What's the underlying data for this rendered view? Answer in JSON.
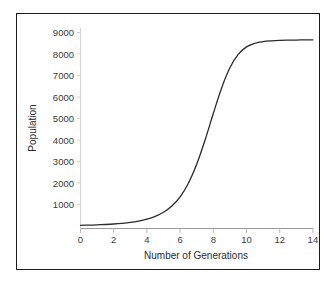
{
  "chart_data": {
    "type": "line",
    "title": "",
    "xlabel": "Number of Generations",
    "ylabel": "Population",
    "xlim": [
      0,
      14.6
    ],
    "ylim": [
      0,
      9400
    ],
    "grid": false,
    "legend": null,
    "x_ticks": [
      "0",
      "2",
      "4",
      "6",
      "8",
      "10",
      "12",
      "14"
    ],
    "x_tick_values": [
      0,
      2,
      4,
      6,
      8,
      10,
      12,
      14
    ],
    "y_ticks": [
      "1000",
      "2000",
      "3000",
      "4000",
      "5000",
      "6000",
      "7000",
      "8000",
      "9000"
    ],
    "y_tick_values": [
      1000,
      2000,
      3000,
      4000,
      5000,
      6000,
      7000,
      8000,
      9000
    ],
    "series": [
      {
        "name": "Population",
        "color": "#2a2a2a",
        "x": [
          0,
          0.5,
          1,
          1.5,
          2,
          2.5,
          3,
          3.5,
          4,
          4.5,
          5,
          5.5,
          6,
          6.5,
          7,
          7.5,
          8,
          8.5,
          9,
          9.5,
          10,
          10.5,
          11,
          11.5,
          12,
          12.5,
          13,
          13.5,
          14
        ],
        "values": [
          30,
          40,
          52,
          70,
          93,
          125,
          168,
          230,
          320,
          450,
          640,
          930,
          1360,
          1990,
          2870,
          3990,
          5230,
          6420,
          7360,
          7980,
          8330,
          8500,
          8580,
          8615,
          8635,
          8645,
          8650,
          8655,
          8658
        ]
      }
    ]
  }
}
